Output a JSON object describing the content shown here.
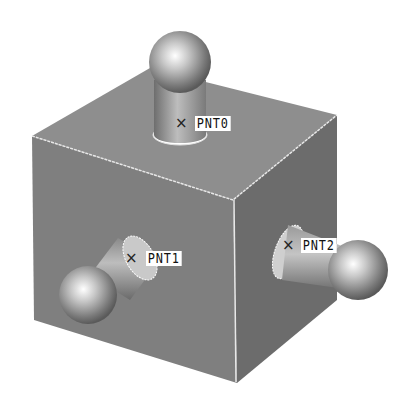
{
  "figure": {
    "colors": {
      "background": "#ffffff",
      "top_face": "#8e8e8e",
      "left_face": "#7f7f7f",
      "right_face": "#6c6c6c",
      "edge_highlight": "#e8e8e8",
      "label_bg": "#ffffff",
      "label_text": "#111111"
    },
    "points": [
      {
        "id": "pnt0",
        "marker": "×",
        "label": "PNT0"
      },
      {
        "id": "pnt1",
        "marker": "×",
        "label": "PNT1"
      },
      {
        "id": "pnt2",
        "marker": "×",
        "label": "PNT2"
      }
    ]
  }
}
